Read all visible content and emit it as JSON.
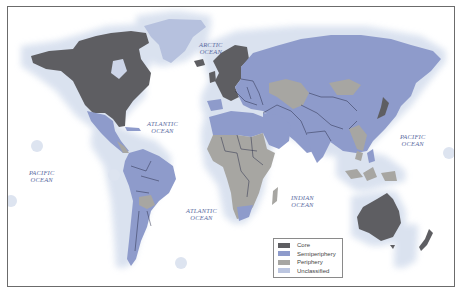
{
  "map": {
    "title": "",
    "oceans": [
      {
        "id": "arctic",
        "line1": "ARCTIC",
        "line2": "OCEAN"
      },
      {
        "id": "atlantic-north",
        "line1": "ATLANTIC",
        "line2": "OCEAN"
      },
      {
        "id": "pacific-west",
        "line1": "PACIFIC",
        "line2": "OCEAN"
      },
      {
        "id": "pacific-east",
        "line1": "PACIFIC",
        "line2": "OCEAN"
      },
      {
        "id": "atlantic-south",
        "line1": "ATLANTIC",
        "line2": "OCEAN"
      },
      {
        "id": "indian",
        "line1": "INDIAN",
        "line2": "OCEAN"
      }
    ],
    "colors": {
      "core": "#5e5e62",
      "semiperiphery": "#8e9bcb",
      "periphery": "#a7a6a2",
      "unclassified": "#bcc6e0",
      "halo": "#dfe6f1",
      "border": "#2a2f4a"
    },
    "legend": {
      "items": [
        {
          "label": "Core",
          "color": "#5e5e62"
        },
        {
          "label": "Semiperiphery",
          "color": "#8e9bcb"
        },
        {
          "label": "Periphery",
          "color": "#a7a6a2"
        },
        {
          "label": "Unclassified",
          "color": "#bcc6e0"
        }
      ]
    }
  }
}
